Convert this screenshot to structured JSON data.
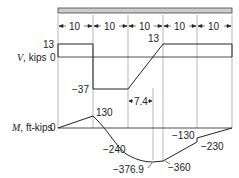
{
  "diagram": {
    "type": "shear-moment-diagram",
    "beam": {
      "segments": [
        "10",
        "10",
        "10",
        "10",
        "10"
      ],
      "fill_color": "#cccccc"
    },
    "shear": {
      "axis_label_sym": "V",
      "axis_label_unit": ", kips",
      "zero_label": "0",
      "top_label": "13",
      "values": {
        "v1": "13",
        "v2": "−37",
        "v3": "13",
        "dist": "7.4"
      },
      "points": [
        [
          0,
          13
        ],
        [
          10,
          13
        ],
        [
          10,
          -37
        ],
        [
          20,
          -37
        ],
        [
          30,
          13
        ],
        [
          50,
          13
        ],
        [
          50,
          0
        ]
      ]
    },
    "moment": {
      "axis_label_sym": "M",
      "axis_label_unit": ", ft-kips",
      "zero_label": "0",
      "values": {
        "m1": "130",
        "m2": "−240",
        "m3": "−376.9",
        "m4": "−360",
        "m5": "−130",
        "m6": "−230"
      }
    },
    "line_color": "#222222",
    "grid_color": "#888888"
  }
}
